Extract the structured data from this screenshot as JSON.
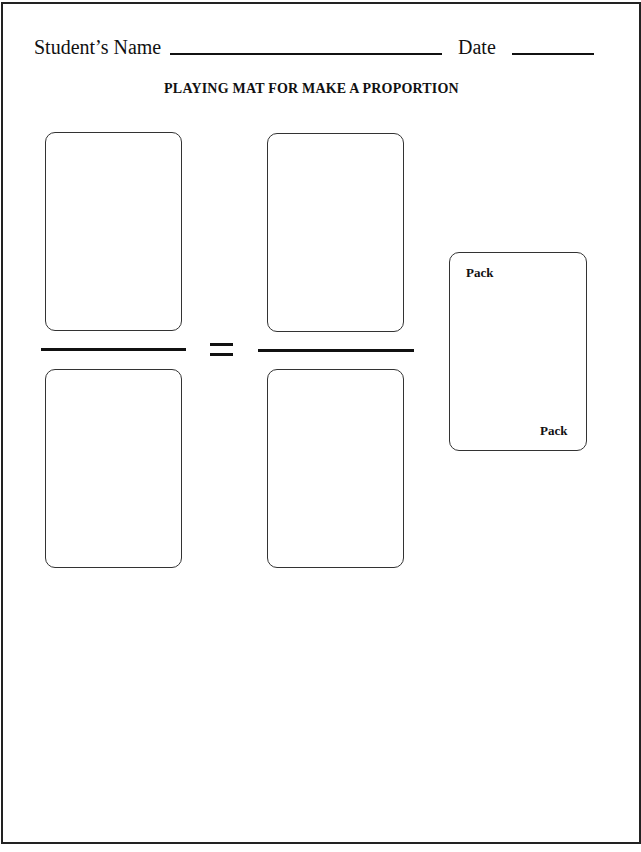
{
  "header": {
    "name_label": "Student’s Name",
    "date_label": "Date"
  },
  "title": "PLAYING MAT FOR MAKE A PROPORTION",
  "mat": {
    "left_fraction": {
      "numerator_card": "",
      "denominator_card": ""
    },
    "operator": "=",
    "right_fraction": {
      "numerator_card": "",
      "denominator_card": ""
    }
  },
  "pack_card": {
    "top_label": "Pack",
    "bottom_label": "Pack"
  }
}
